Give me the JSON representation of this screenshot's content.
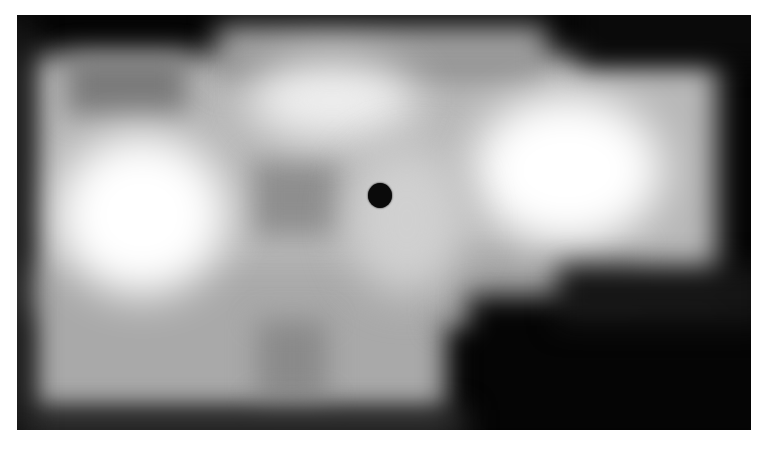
{
  "image": {
    "description": "Grayscale blurred intensity map with a black dot marker near center",
    "colors": {
      "background": "#ffffff",
      "frame": "#050505",
      "bright": "#ffffff",
      "mid": "#bdbdbd",
      "shadow": "#8a8a8a",
      "marker": "#0a0a0a"
    },
    "marker": {
      "x": 380,
      "y": 195,
      "w": 24,
      "h": 24
    }
  }
}
